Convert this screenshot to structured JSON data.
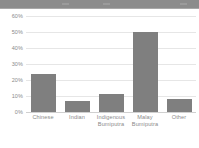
{
  "toolbar": {
    "name": "window-toolbar",
    "marks": [
      "mark-1",
      "mark-2",
      "mark-3"
    ]
  },
  "chart_data": {
    "type": "bar",
    "title": "",
    "subtitle": "",
    "xlabel": "",
    "ylabel": "",
    "categories": [
      "Chinese",
      "Indian",
      "Indigenous Bumiputra",
      "Malay Bumiputra",
      "Other"
    ],
    "category_lines": [
      [
        "Chinese"
      ],
      [
        "Indian"
      ],
      [
        "Indigenous",
        "Bumiputra"
      ],
      [
        "Malay",
        "Bumiputra"
      ],
      [
        "Other"
      ]
    ],
    "values": [
      24,
      7,
      11,
      50,
      8
    ],
    "value_suffix": "%",
    "ylim": [
      0,
      60
    ],
    "yticks": [
      60,
      50,
      40,
      30,
      20,
      10,
      0
    ],
    "ytick_labels": [
      "60%",
      "50%",
      "40%",
      "30%",
      "20%",
      "10%",
      "0%"
    ],
    "grid": true,
    "legend": "none",
    "bar_color": "#7f7f7f",
    "grid_color": "#e6e6e6",
    "axis_text_color": "#8a8a8a",
    "background": "#ffffff"
  }
}
